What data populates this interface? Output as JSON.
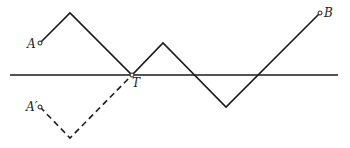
{
  "diagram": {
    "colors": {
      "stroke": "#1a1a1a",
      "background": "#ffffff"
    },
    "axis": {
      "x1": 10,
      "y": 75,
      "x2": 338
    },
    "path_points": [
      [
        40,
        43
      ],
      [
        70,
        13
      ],
      [
        132,
        75
      ],
      [
        163,
        43
      ],
      [
        226,
        107
      ],
      [
        320,
        13
      ]
    ],
    "reflected_points": [
      [
        40,
        107
      ],
      [
        70,
        138
      ],
      [
        132,
        75
      ]
    ],
    "points": {
      "A": {
        "label": "A",
        "x": 40,
        "y": 43
      },
      "A_prime": {
        "label": "A′",
        "x": 40,
        "y": 107
      },
      "T": {
        "label": "T",
        "x": 132,
        "y": 75
      },
      "B": {
        "label": "B",
        "x": 320,
        "y": 13
      }
    }
  }
}
